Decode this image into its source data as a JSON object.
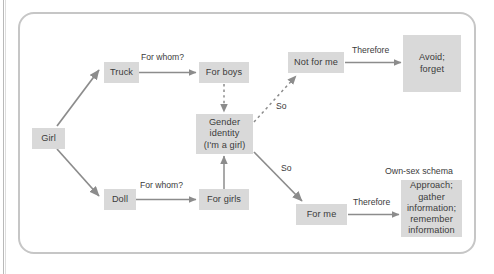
{
  "figure": {
    "panel": {
      "border_color": "#c6c6c6",
      "background": "#ffffff"
    },
    "node_fill": "#d9d9d9",
    "text_color": "#3b3b3b",
    "arrow_color": "#8c8c8c"
  },
  "nodes": [
    {
      "id": "girl",
      "label": "Girl"
    },
    {
      "id": "truck",
      "label": "Truck"
    },
    {
      "id": "doll",
      "label": "Doll"
    },
    {
      "id": "for_boys",
      "label": "For boys"
    },
    {
      "id": "for_girls",
      "label": "For girls"
    },
    {
      "id": "gender_identity",
      "label": "Gender\nidentity\n(I'm a girl)"
    },
    {
      "id": "not_for_me",
      "label": "Not for me"
    },
    {
      "id": "for_me",
      "label": "For me"
    },
    {
      "id": "avoid",
      "label": "Avoid;\nforget"
    },
    {
      "id": "approach",
      "label": "Approach;\ngather\ninformation;\nremember\ninformation"
    }
  ],
  "edge_labels": [
    {
      "id": "truck_for_whom",
      "text": "For whom?"
    },
    {
      "id": "doll_for_whom",
      "text": "For whom?"
    },
    {
      "id": "so_upper",
      "text": "So"
    },
    {
      "id": "so_lower",
      "text": "So"
    },
    {
      "id": "therefore_upper",
      "text": "Therefore"
    },
    {
      "id": "therefore_lower",
      "text": "Therefore"
    }
  ],
  "group_labels": [
    {
      "id": "own_sex_schema",
      "text": "Own-sex schema"
    }
  ]
}
